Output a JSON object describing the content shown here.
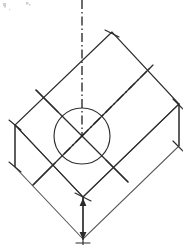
{
  "drawing": {
    "title": "Isometric block with central circular feature",
    "type": "engineering-isometric-projection",
    "caption": "",
    "background_color": "#ffffff",
    "line_color": "#2b2b2b",
    "soft_line_color": "#585858",
    "centerline_color": "#1f1f1f",
    "canvas": {
      "width": 183,
      "height": 251
    },
    "labels": {
      "top_face": "",
      "front_face": "",
      "side_face": "",
      "circle": "",
      "vertical_centerline": "",
      "diagonal_centerline": ""
    },
    "geometry": {
      "top_face_vertices": [
        {
          "name": "rear",
          "x": 112,
          "y": 32
        },
        {
          "name": "left",
          "x": 15,
          "y": 125
        },
        {
          "name": "front",
          "x": 83,
          "y": 197
        },
        {
          "name": "right",
          "x": 179,
          "y": 104
        }
      ],
      "depth_offset": {
        "dx": 0,
        "dy": 42
      },
      "circle": {
        "cx": 82,
        "cy": 136,
        "r": 28
      },
      "vertical_centerline": {
        "x": 82,
        "y1": 0,
        "y2": 136
      },
      "diagonal_centerline": {
        "x1": 82,
        "y1": 136,
        "x2": 152,
        "y2": 66
      },
      "front_dimension": {
        "x": 83,
        "y1": 197,
        "y2": 245
      }
    },
    "elements": [
      {
        "name": "top-face-outline",
        "kind": "parallelogram"
      },
      {
        "name": "left-side-face",
        "kind": "quadrilateral"
      },
      {
        "name": "right-side-face",
        "kind": "quadrilateral"
      },
      {
        "name": "center-circle",
        "kind": "circle"
      },
      {
        "name": "vertical-centerline",
        "kind": "dash-dot-line"
      },
      {
        "name": "diagonal-centerline",
        "kind": "dash-dot-line"
      },
      {
        "name": "major-axis-line",
        "kind": "line"
      },
      {
        "name": "minor-axis-line",
        "kind": "line"
      },
      {
        "name": "front-depth-dimension",
        "kind": "dimension-line"
      },
      {
        "name": "left-depth-edge",
        "kind": "line"
      },
      {
        "name": "right-depth-edge",
        "kind": "line"
      }
    ]
  }
}
